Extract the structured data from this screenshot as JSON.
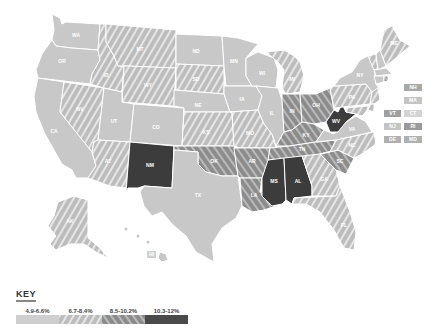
{
  "map": {
    "title": "",
    "colors": {
      "c1": "#c8c8c8",
      "c2_base": "#bdbdbd",
      "c2_stripe": "#e4e4e4",
      "c3_base": "#8e8e8e",
      "c3_stripe": "#b8b8b8",
      "c4": "#3c3c3c"
    },
    "states": [
      {
        "abbr": "WA",
        "category": "4.9-6.6%"
      },
      {
        "abbr": "OR",
        "category": "4.9-6.6%"
      },
      {
        "abbr": "CA",
        "category": "4.9-6.6%"
      },
      {
        "abbr": "NV",
        "category": "6.7-8.4%"
      },
      {
        "abbr": "ID",
        "category": "6.7-8.4%"
      },
      {
        "abbr": "MT",
        "category": "6.7-8.4%"
      },
      {
        "abbr": "WY",
        "category": "6.7-8.4%"
      },
      {
        "abbr": "UT",
        "category": "4.9-6.6%"
      },
      {
        "abbr": "AZ",
        "category": "6.7-8.4%"
      },
      {
        "abbr": "CO",
        "category": "4.9-6.6%"
      },
      {
        "abbr": "NM",
        "category": "10.3-12%"
      },
      {
        "abbr": "ND",
        "category": "4.9-6.6%"
      },
      {
        "abbr": "SD",
        "category": "6.7-8.4%"
      },
      {
        "abbr": "NE",
        "category": "4.9-6.6%"
      },
      {
        "abbr": "KS",
        "category": "6.7-8.4%"
      },
      {
        "abbr": "OK",
        "category": "8.5-10.2%"
      },
      {
        "abbr": "TX",
        "category": "4.9-6.6%"
      },
      {
        "abbr": "MN",
        "category": "4.9-6.6%"
      },
      {
        "abbr": "IA",
        "category": "4.9-6.6%"
      },
      {
        "abbr": "MO",
        "category": "6.7-8.4%"
      },
      {
        "abbr": "AR",
        "category": "8.5-10.2%"
      },
      {
        "abbr": "LA",
        "category": "8.5-10.2%"
      },
      {
        "abbr": "WI",
        "category": "4.9-6.6%"
      },
      {
        "abbr": "IL",
        "category": "4.9-6.6%"
      },
      {
        "abbr": "MI",
        "category": "6.7-8.4%"
      },
      {
        "abbr": "IN",
        "category": "8.5-10.2%"
      },
      {
        "abbr": "OH",
        "category": "8.5-10.2%"
      },
      {
        "abbr": "KY",
        "category": "8.5-10.2%"
      },
      {
        "abbr": "TN",
        "category": "8.5-10.2%"
      },
      {
        "abbr": "MS",
        "category": "10.3-12%"
      },
      {
        "abbr": "AL",
        "category": "10.3-12%"
      },
      {
        "abbr": "GA",
        "category": "6.7-8.4%"
      },
      {
        "abbr": "FL",
        "category": "6.7-8.4%"
      },
      {
        "abbr": "SC",
        "category": "8.5-10.2%"
      },
      {
        "abbr": "NC",
        "category": "6.7-8.4%"
      },
      {
        "abbr": "VA",
        "category": "4.9-6.6%"
      },
      {
        "abbr": "WV",
        "category": "10.3-12%"
      },
      {
        "abbr": "PA",
        "category": "6.7-8.4%"
      },
      {
        "abbr": "NY",
        "category": "4.9-6.6%"
      },
      {
        "abbr": "ME",
        "category": "6.7-8.4%"
      },
      {
        "abbr": "NH",
        "category": "4.9-6.6%"
      },
      {
        "abbr": "VT",
        "category": "6.7-8.4%"
      },
      {
        "abbr": "MA",
        "category": "4.9-6.6%"
      },
      {
        "abbr": "CT",
        "category": "4.9-6.6%"
      },
      {
        "abbr": "RI",
        "category": "8.5-10.2%"
      },
      {
        "abbr": "NJ",
        "category": "6.7-8.4%"
      },
      {
        "abbr": "DE",
        "category": "6.7-8.4%"
      },
      {
        "abbr": "MD",
        "category": "6.7-8.4%"
      },
      {
        "abbr": "AK",
        "category": "6.7-8.4%"
      },
      {
        "abbr": "HI",
        "category": "4.9-6.6%"
      }
    ],
    "small_state_boxes": [
      {
        "abbr": "NH",
        "col": 2,
        "row": 0
      },
      {
        "abbr": "MA",
        "col": 2,
        "row": 1
      },
      {
        "abbr": "VT",
        "col": 1,
        "row": 2
      },
      {
        "abbr": "CT",
        "col": 2,
        "row": 2
      },
      {
        "abbr": "NJ",
        "col": 1,
        "row": 3
      },
      {
        "abbr": "RI",
        "col": 2,
        "row": 3
      },
      {
        "abbr": "DE",
        "col": 1,
        "row": 4
      },
      {
        "abbr": "MD",
        "col": 2,
        "row": 4
      }
    ]
  },
  "key": {
    "title": "KEY",
    "items": [
      {
        "label": "4.9-6.6%"
      },
      {
        "label": "6.7-8.4%"
      },
      {
        "label": "8.5-10.2%"
      },
      {
        "label": "10.3-12%"
      }
    ]
  },
  "labels": {
    "WA": "WA",
    "OR": "OR",
    "CA": "CA",
    "NV": "NV",
    "ID": "ID",
    "MT": "MT",
    "WY": "WY",
    "UT": "UT",
    "AZ": "AZ",
    "CO": "CO",
    "NM": "NM",
    "ND": "ND",
    "SD": "SD",
    "NE": "NE",
    "KS": "KS",
    "OK": "OK",
    "TX": "TX",
    "MN": "MN",
    "IA": "IA",
    "MO": "MO",
    "AR": "AR",
    "LA": "LA",
    "WI": "WI",
    "IL": "IL",
    "MI": "MI",
    "IN": "IN",
    "OH": "OH",
    "KY": "KY",
    "TN": "TN",
    "MS": "MS",
    "AL": "AL",
    "GA": "GA",
    "FL": "FL",
    "SC": "SC",
    "NC": "NC",
    "VA": "VA",
    "WV": "WV",
    "PA": "PA",
    "NY": "NY",
    "ME": "ME",
    "AK": "AK",
    "HI": "HI",
    "NH": "NH",
    "MA": "MA",
    "VT": "VT",
    "CT": "CT",
    "NJ": "NJ",
    "RI": "RI",
    "DE": "DE",
    "MD": "MD"
  }
}
